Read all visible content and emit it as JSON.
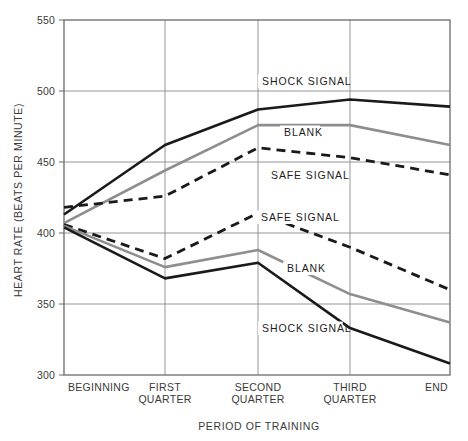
{
  "chart_data": {
    "type": "line",
    "title": "",
    "xlabel": "PERIOD OF TRAINING",
    "ylabel": "HEART RATE (BEATS PER MINUTE)",
    "categories": [
      "BEGINNING",
      "FIRST QUARTER",
      "SECOND QUARTER",
      "THIRD QUARTER",
      "END"
    ],
    "category_lines": [
      [
        "BEGINNING"
      ],
      [
        "FIRST",
        "QUARTER"
      ],
      [
        "SECOND",
        "QUARTER"
      ],
      [
        "THIRD",
        "QUARTER"
      ],
      [
        "END"
      ]
    ],
    "ylim": [
      300,
      550
    ],
    "yticks": [
      300,
      350,
      400,
      450,
      500,
      550
    ],
    "ytick_labels": [
      "300",
      "350",
      "400",
      "450",
      "500",
      "550"
    ],
    "grid": true,
    "legend": "inline-labels",
    "series": [
      {
        "name": "SHOCK SIGNAL",
        "group": "upper",
        "style": "solid",
        "color": "#1a1a1a",
        "width": 2.6,
        "values": [
          413,
          462,
          487,
          494,
          489
        ],
        "label": "SHOCK SIGNAL",
        "label_x": 262,
        "label_y": 85
      },
      {
        "name": "BLANK",
        "group": "upper",
        "style": "solid",
        "color": "#8e8e8e",
        "width": 2.6,
        "values": [
          407,
          444,
          476,
          476,
          462
        ],
        "label": "BLANK",
        "label_x": 284,
        "label_y": 136
      },
      {
        "name": "SAFE SIGNAL",
        "group": "upper",
        "style": "dashed",
        "color": "#1a1a1a",
        "width": 2.8,
        "values": [
          418,
          426,
          460,
          453,
          441
        ],
        "label": "SAFE SIGNAL",
        "label_x": 271,
        "label_y": 179
      },
      {
        "name": "SAFE SIGNAL",
        "group": "lower",
        "style": "dashed",
        "color": "#1a1a1a",
        "width": 2.8,
        "values": [
          406,
          382,
          414,
          390,
          360
        ],
        "label": "SAFE SIGNAL",
        "label_x": 261,
        "label_y": 221
      },
      {
        "name": "BLANK",
        "group": "lower",
        "style": "solid",
        "color": "#8e8e8e",
        "width": 2.6,
        "values": [
          405,
          376,
          388,
          357,
          337
        ],
        "label": "BLANK",
        "label_x": 287,
        "label_y": 272
      },
      {
        "name": "SHOCK SIGNAL",
        "group": "lower",
        "style": "solid",
        "color": "#1a1a1a",
        "width": 2.6,
        "values": [
          404,
          368,
          379,
          333,
          308
        ],
        "label": "SHOCK SIGNAL",
        "label_x": 262,
        "label_y": 332
      }
    ]
  },
  "axes": {
    "frame_color": "#6a6a6a",
    "grid_color": "#8a8a8a",
    "background": "#ffffff"
  }
}
